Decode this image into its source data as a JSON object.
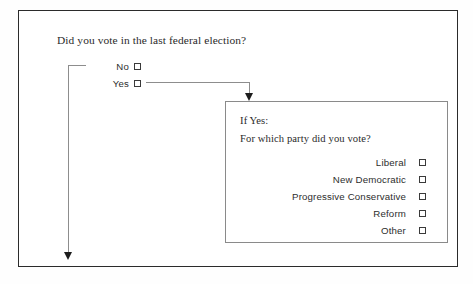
{
  "form": {
    "main_question": "Did you vote in the last federal election?",
    "options": [
      {
        "label": "No",
        "checkbox": "checkbox-unchecked"
      },
      {
        "label": "Yes",
        "checkbox": "checkbox-unchecked"
      }
    ],
    "branch_box": {
      "heading": "If Yes:",
      "question": "For which party did you vote?",
      "parties": [
        {
          "label": "Liberal",
          "checkbox": "checkbox-unchecked"
        },
        {
          "label": "New Democratic",
          "checkbox": "checkbox-unchecked"
        },
        {
          "label": "Progressive Conservative",
          "checkbox": "checkbox-unchecked"
        },
        {
          "label": "Reform",
          "checkbox": "checkbox-unchecked"
        },
        {
          "label": "Other",
          "checkbox": "checkbox-unchecked"
        }
      ]
    }
  },
  "colors": {
    "frame": "#2b2b2b",
    "inner_frame": "#8a8a8a",
    "connector": "#8d8d8d",
    "arrowhead": "#1d1d1d",
    "text": "#2a2a2a",
    "background": "#ffffff"
  }
}
